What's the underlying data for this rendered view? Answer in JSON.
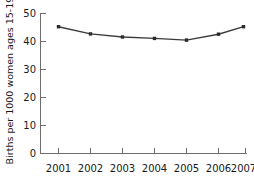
{
  "chart_data": {
    "type": "line",
    "title": "",
    "xlabel": "",
    "ylabel": "Births per 1000 women ages 15-19",
    "categories": [
      "2001",
      "2002",
      "2003",
      "2004",
      "2005",
      "2006",
      "2007"
    ],
    "x": [
      2001,
      2002,
      2003,
      2004,
      2005,
      2006,
      2007
    ],
    "values": [
      45.3,
      42.7,
      41.6,
      41.1,
      40.5,
      42.6,
      45.3
    ],
    "series": [
      {
        "name": "Births per 1000 women ages 15-19",
        "values": [
          45.3,
          42.7,
          41.6,
          41.1,
          40.5,
          42.6,
          45.3
        ]
      }
    ],
    "ylim": [
      0,
      50
    ],
    "yticks": [
      0,
      10,
      20,
      30,
      40,
      50
    ],
    "ytick_labels": [
      "0",
      "10",
      "20",
      "30",
      "40",
      "50"
    ],
    "xtick_labels": [
      "2001",
      "2002",
      "2003",
      "2004",
      "2005",
      "2006",
      "2007"
    ],
    "grid": false,
    "legend": false,
    "legend_position": "none",
    "marker": "square",
    "line_color": "#3c3c3c",
    "marker_color": "#2b2b2b",
    "axis_color": "#6e6e6e",
    "background_color": "#ffffff",
    "text_color": "#1a1a1a"
  }
}
